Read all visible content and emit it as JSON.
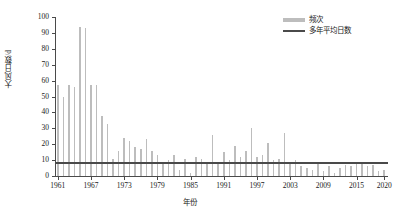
{
  "chart_data": {
    "type": "bar",
    "title": "",
    "xlabel": "年份",
    "ylabel": "大风日数/d",
    "ylim": [
      0,
      100
    ],
    "ytick_labels": [
      "0",
      "10",
      "20",
      "30",
      "40",
      "50",
      "60",
      "70",
      "80",
      "90",
      "100"
    ],
    "xtick_labels": [
      "1961",
      "1967",
      "1973",
      "1979",
      "1985",
      "1991",
      "1997",
      "2003",
      "2009",
      "2015",
      "2020"
    ],
    "grid": false,
    "legend_position": "top-right",
    "legend": [
      {
        "name": "频次",
        "marker": "bar",
        "color": "#bdbdbd"
      },
      {
        "name": "多年平均日数",
        "marker": "line",
        "color": "#4a4a4a"
      }
    ],
    "series": [
      {
        "name": "频次",
        "type": "bar",
        "color": "#bdbdbd",
        "x": [
          1961,
          1962,
          1963,
          1964,
          1965,
          1966,
          1967,
          1968,
          1969,
          1970,
          1971,
          1972,
          1973,
          1974,
          1975,
          1976,
          1977,
          1978,
          1979,
          1980,
          1981,
          1982,
          1983,
          1984,
          1985,
          1986,
          1987,
          1988,
          1989,
          1990,
          1991,
          1992,
          1993,
          1994,
          1995,
          1996,
          1997,
          1998,
          1999,
          2000,
          2001,
          2002,
          2003,
          2004,
          2005,
          2006,
          2007,
          2008,
          2009,
          2010,
          2011,
          2012,
          2013,
          2014,
          2015,
          2016,
          2017,
          2018,
          2019,
          2020
        ],
        "values": [
          57,
          50,
          57,
          56,
          94,
          93,
          57,
          57,
          38,
          33,
          11,
          16,
          24,
          22,
          18,
          17,
          23,
          16,
          13,
          9,
          10,
          13,
          4,
          11,
          2,
          12,
          11,
          9,
          26,
          9,
          15,
          10,
          19,
          12,
          16,
          30,
          12,
          13,
          21,
          10,
          11,
          27,
          9,
          10,
          6,
          5,
          4,
          8,
          3,
          6,
          2,
          5,
          7,
          6,
          9,
          8,
          6,
          7,
          3,
          4
        ]
      },
      {
        "name": "多年平均日数",
        "type": "line",
        "color": "#4a4a4a",
        "constant_value": 9
      }
    ]
  }
}
